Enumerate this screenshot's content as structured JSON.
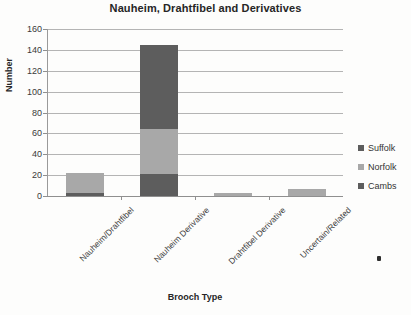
{
  "chart_data": {
    "type": "bar",
    "subtype": "stacked-bar",
    "title": "Nauheim, Drahtfibel and Derivatives",
    "xlabel": "Brooch Type",
    "ylabel": "Number",
    "categories": [
      "Nauheim/Drahtfibel",
      "Nauheim Derivative",
      "Drahtfibel Derivative",
      "Uncertain/Related"
    ],
    "series": [
      {
        "name": "Cambs",
        "values": [
          3,
          21,
          0,
          0
        ],
        "color": "#5d5d5d"
      },
      {
        "name": "Norfolk",
        "values": [
          19,
          43,
          3,
          7
        ],
        "color": "#a8a8a8"
      },
      {
        "name": "Suffolk",
        "values": [
          0,
          81,
          0,
          0
        ],
        "color": "#5d5d5d"
      }
    ],
    "stack_order_bottom_to_top": [
      "Cambs",
      "Norfolk",
      "Suffolk"
    ],
    "totals": [
      22,
      145,
      3,
      7
    ],
    "ylim": [
      0,
      160
    ],
    "ytick_step": 20,
    "yticks": [
      0,
      20,
      40,
      60,
      80,
      100,
      120,
      140,
      160
    ],
    "grid": "horizontal",
    "legend_position": "right",
    "legend_order_top_to_bottom": [
      "Suffolk",
      "Norfolk",
      "Cambs"
    ],
    "xtick_label_rotation_deg": -45
  },
  "legend": {
    "items": [
      {
        "label": "Suffolk",
        "color": "#5d5d5d"
      },
      {
        "label": "Norfolk",
        "color": "#a8a8a8"
      },
      {
        "label": "Cambs",
        "color": "#5d5d5d"
      }
    ]
  },
  "colors": {
    "background": "#fdfdfc",
    "gridline": "#b4b4b4",
    "axis": "#8f8f8f",
    "text": "#2b2b2b",
    "dark_gray_series": "#5d5d5d",
    "light_gray_series": "#a8a8a8"
  }
}
